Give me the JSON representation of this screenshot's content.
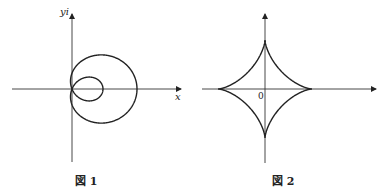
{
  "figures": [
    {
      "id": "fig1",
      "caption": "図 1",
      "x_axis_label": "x",
      "y_axis_label": "yi",
      "curve": "limaçon with inner loop",
      "origin": [
        72,
        89
      ]
    },
    {
      "id": "fig2",
      "caption": "図 2",
      "origin_label": "0",
      "curve": "astroid",
      "origin": [
        265,
        89
      ]
    }
  ],
  "colors": {
    "stroke": "#222222",
    "background": "#ffffff"
  }
}
